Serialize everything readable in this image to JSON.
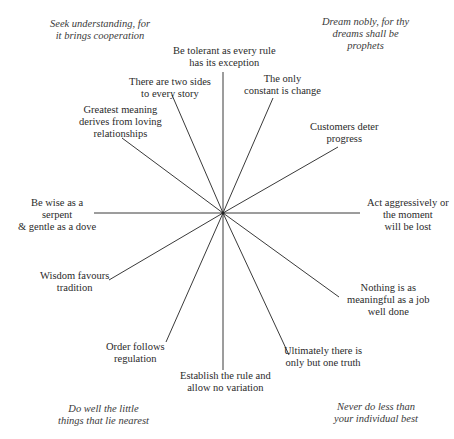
{
  "diagram": {
    "type": "radial-spoke",
    "center": {
      "x": 223,
      "y": 213
    },
    "line_color": "#3a3a3a",
    "spokes": [
      {
        "id": "tolerant",
        "lines": [
          "Be tolerant as every rule",
          "has its exception"
        ],
        "end": [
          223,
          72
        ]
      },
      {
        "id": "only-constant",
        "lines": [
          "The only",
          "constant is change"
        ],
        "end": [
          273,
          98
        ]
      },
      {
        "id": "customers",
        "lines": [
          "Customers deter",
          "progress"
        ],
        "end": [
          338,
          147
        ]
      },
      {
        "id": "act-aggressively",
        "lines": [
          "Act aggressively or",
          "the moment",
          "will be lost"
        ],
        "end": [
          360,
          213
        ]
      },
      {
        "id": "job-well-done",
        "lines": [
          "Nothing is as",
          "meaningful as a job",
          "well done"
        ],
        "end": [
          339,
          297
        ]
      },
      {
        "id": "one-truth",
        "lines": [
          "Ultimately there is",
          "only but one truth"
        ],
        "end": [
          289,
          355
        ]
      },
      {
        "id": "establish-rule",
        "lines": [
          "Establish the rule and",
          "allow no variation"
        ],
        "end": [
          223,
          370
        ]
      },
      {
        "id": "order-regulation",
        "lines": [
          "Order follows",
          "regulation"
        ],
        "end": [
          166,
          342
        ]
      },
      {
        "id": "wisdom-tradition",
        "lines": [
          "Wisdom favours",
          "tradition"
        ],
        "end": [
          109,
          280
        ]
      },
      {
        "id": "wise-serpent",
        "lines": [
          "Be wise as a",
          "serpent",
          "& gentle as a dove"
        ],
        "end": [
          94,
          213
        ]
      },
      {
        "id": "greatest-meaning",
        "lines": [
          "Greatest meaning",
          "derives from loving",
          "relationships"
        ],
        "end": [
          122,
          138
        ]
      },
      {
        "id": "two-sides",
        "lines": [
          "There are two sides",
          "to every story"
        ],
        "end": [
          172,
          95
        ]
      }
    ],
    "corners": {
      "top_left": [
        "Seek understanding, for",
        "it brings cooperation"
      ],
      "top_right": [
        "Dream nobly, for thy",
        "dreams shall be",
        "prophets"
      ],
      "bottom_left": [
        "Do well the little",
        "things that lie nearest"
      ],
      "bottom_right": [
        "Never do less than",
        "your individual best"
      ]
    }
  }
}
